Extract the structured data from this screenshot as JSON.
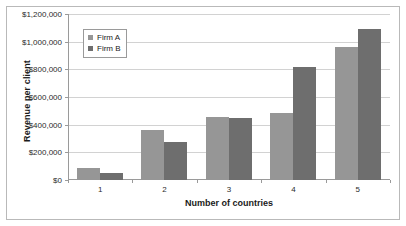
{
  "chart_data": {
    "type": "bar",
    "title": "",
    "xlabel": "Number of countries",
    "ylabel": "Revenue per client",
    "categories": [
      "1",
      "2",
      "3",
      "4",
      "5"
    ],
    "series": [
      {
        "name": "Firm A",
        "color": "#969696",
        "values": [
          90000,
          360000,
          455000,
          485000,
          965000
        ]
      },
      {
        "name": "Firm B",
        "color": "#6e6e6e",
        "values": [
          50000,
          275000,
          445000,
          820000,
          1090000
        ]
      }
    ],
    "ylim": [
      0,
      1200000
    ],
    "ytick_values": [
      0,
      200000,
      400000,
      600000,
      800000,
      1000000,
      1200000
    ],
    "ytick_labels": [
      "$0",
      "$200,000",
      "$400,000",
      "$600,000",
      "$800,000",
      "$1,000,000",
      "$1,200,000"
    ],
    "grid": true,
    "legend_position": "top-left-inside"
  },
  "legend": {
    "entries": [
      {
        "label": "Firm A"
      },
      {
        "label": "Firm B"
      }
    ]
  },
  "axes": {
    "y_title": "Revenue per client",
    "x_title": "Number of countries"
  }
}
